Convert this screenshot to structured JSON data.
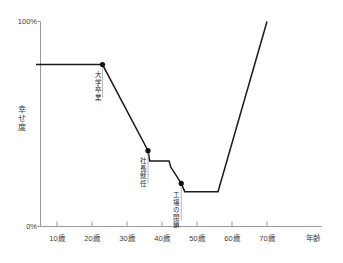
{
  "chart_data": {
    "type": "line",
    "title": "",
    "xlabel": "年齢",
    "ylabel": "幸せ度",
    "xlim": [
      0,
      75
    ],
    "ylim": [
      0,
      100
    ],
    "grid": false,
    "legend": "none",
    "x_tick_labels": [
      "10歳",
      "20歳",
      "30歳",
      "40歳",
      "50歳",
      "60歳",
      "70歳"
    ],
    "x_tick_values": [
      10,
      20,
      30,
      40,
      50,
      60,
      70
    ],
    "y_tick_labels": [
      "0%",
      "100%"
    ],
    "y_tick_values": [
      0,
      100
    ],
    "series": [
      {
        "name": "幸せ度",
        "color": "#1a1a1a",
        "points": [
          {
            "x": 4,
            "y": 79
          },
          {
            "x": 23,
            "y": 79
          },
          {
            "x": 36,
            "y": 37
          },
          {
            "x": 36.5,
            "y": 32
          },
          {
            "x": 42,
            "y": 32
          },
          {
            "x": 42.5,
            "y": 29
          },
          {
            "x": 45.5,
            "y": 21
          },
          {
            "x": 46.5,
            "y": 17
          },
          {
            "x": 56,
            "y": 17
          },
          {
            "x": 70,
            "y": 100
          }
        ]
      }
    ],
    "markers": [
      {
        "x": 23,
        "y": 79,
        "label": "大学卒業"
      },
      {
        "x": 36,
        "y": 37,
        "label": "社長就任"
      },
      {
        "x": 45.5,
        "y": 21,
        "label": "工場の閉鎖"
      }
    ],
    "annotations": [
      {
        "text": "大学卒業",
        "anchor_x": 23,
        "anchor_y": 79
      },
      {
        "text": "社長就任",
        "anchor_x": 36,
        "anchor_y": 37
      },
      {
        "text": "工場の閉鎖",
        "anchor_x": 45.5,
        "anchor_y": 21
      }
    ],
    "colors": {
      "line": "#1a1a1a",
      "axis": "#9a9a9a",
      "marker": "#111111",
      "background": "#ffffff",
      "text": "#3a3a3a"
    }
  }
}
